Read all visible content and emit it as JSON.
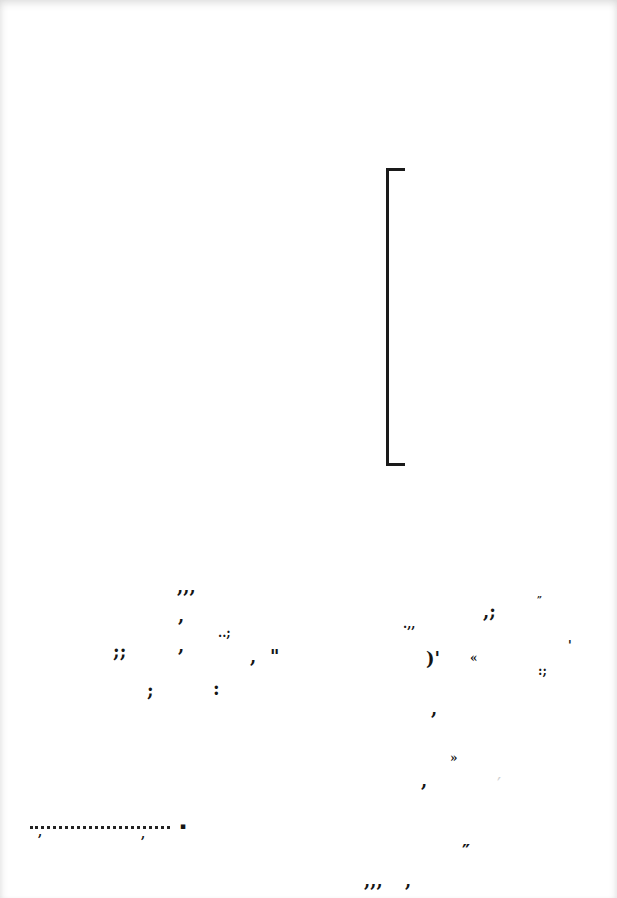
{
  "document": {
    "type": "scanned-page",
    "bracket": {
      "glyph": "[",
      "x": 386,
      "y": 168,
      "width": 16,
      "height": 292
    },
    "left_cluster": [
      {
        "text": ",,,",
        "x": 177,
        "y": 578,
        "size": "normal"
      },
      {
        "text": ",",
        "x": 178,
        "y": 607,
        "size": "normal"
      },
      {
        "text": "..;",
        "x": 218,
        "y": 627,
        "size": "small"
      },
      {
        "text": ";;",
        "x": 113,
        "y": 643,
        "size": "normal"
      },
      {
        "text": ",",
        "x": 178,
        "y": 637,
        "size": "normal"
      },
      {
        "text": ",",
        "x": 250,
        "y": 648,
        "size": "normal"
      },
      {
        "text": "\"",
        "x": 270,
        "y": 648,
        "size": "normal"
      },
      {
        "text": ";",
        "x": 147,
        "y": 682,
        "size": "normal"
      },
      {
        "text": ":",
        "x": 213,
        "y": 680,
        "size": "normal"
      }
    ],
    "right_cluster": [
      {
        "text": "„",
        "x": 537,
        "y": 590,
        "size": "tiny"
      },
      {
        "text": ".,,",
        "x": 403,
        "y": 618,
        "size": "small"
      },
      {
        "text": ",;",
        "x": 483,
        "y": 603,
        "size": "normal"
      },
      {
        "text": "'",
        "x": 568,
        "y": 640,
        "size": "small"
      },
      {
        "text": ")'",
        "x": 426,
        "y": 650,
        "size": "normal"
      },
      {
        "text": "«",
        "x": 470,
        "y": 652,
        "size": "small"
      },
      {
        "text": ":;",
        "x": 538,
        "y": 665,
        "size": "small"
      },
      {
        "text": ",",
        "x": 431,
        "y": 700,
        "size": "normal"
      }
    ],
    "bottom_cluster": [
      {
        "text": "»",
        "x": 450,
        "y": 752,
        "size": "small"
      },
      {
        "text": ",",
        "x": 421,
        "y": 772,
        "size": "normal"
      },
      {
        "text": "′",
        "x": 497,
        "y": 776,
        "size": "faint"
      },
      {
        "text": "″",
        "x": 462,
        "y": 843,
        "size": "normal"
      },
      {
        "text": ",,,",
        "x": 364,
        "y": 872,
        "size": "normal"
      },
      {
        "text": ",",
        "x": 405,
        "y": 872,
        "size": "normal"
      }
    ],
    "dot_leader": {
      "x": 30,
      "y": 826,
      "width": 140,
      "commas": [
        {
          "x": 38,
          "y": 826
        },
        {
          "x": 141,
          "y": 828
        }
      ],
      "end_dot": {
        "text": "▪",
        "x": 180,
        "y": 822
      }
    }
  }
}
